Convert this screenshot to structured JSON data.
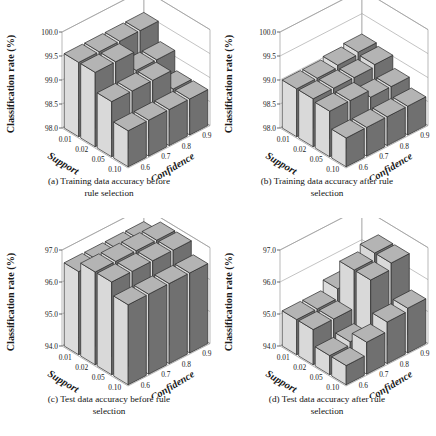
{
  "figure": {
    "background": "#ffffff",
    "ink": "#1a1a1a"
  },
  "colors": {
    "bar_top": "#b4b4b4",
    "bar_left": "#d9d9d9",
    "bar_right": "#707070",
    "bar_front_light": "#dcdcdc",
    "bar_mid": "#9a9a9a",
    "edge": "#2a2a2a",
    "wall": "#9b9b9b",
    "floor": "#ffffff"
  },
  "axes": {
    "ylabel": "Classification rate (%)",
    "xlabel": "Support",
    "zlabel": "Confidence",
    "support_ticks": [
      "0.01",
      "0.02",
      "0.05",
      "0.10"
    ],
    "confidence_ticks": [
      "0.6",
      "0.7",
      "0.8",
      "0.9"
    ]
  },
  "panels": [
    {
      "id": "a",
      "caption": "(a) Training data accuracy before rule selection",
      "caption_line1": "(a) Training data accuracy before",
      "caption_line2": "rule selection",
      "yticks": [
        "98.0",
        "98.5",
        "99.0",
        "99.5",
        "100.0"
      ]
    },
    {
      "id": "b",
      "caption": "(b) Training data accuracy after rule selection",
      "caption_line1": "(b) Training data accuracy after rule",
      "caption_line2": "selection",
      "yticks": [
        "98.0",
        "98.5",
        "99.0",
        "99.5",
        "100.0"
      ]
    },
    {
      "id": "c",
      "caption": "(c) Test data accuracy before rule selection",
      "caption_line1": "(c) Test data accuracy before rule",
      "caption_line2": "selection",
      "yticks": [
        "94.0",
        "95.0",
        "96.0",
        "97.0"
      ]
    },
    {
      "id": "d",
      "caption": "(d) Test data accuracy after rule selection",
      "caption_line1": "(d) Test data accuracy after rule",
      "caption_line2": "selection",
      "yticks": [
        "94.0",
        "95.0",
        "96.0",
        "97.0"
      ]
    }
  ],
  "chart_data": [
    {
      "type": "bar",
      "panel": "a",
      "title": "(a) Training data accuracy before rule selection",
      "xlabel": "Support",
      "ylabel": "Classification rate (%)",
      "zlabel": "Confidence",
      "categories_x": [
        "0.01",
        "0.02",
        "0.05",
        "0.10"
      ],
      "categories_z": [
        "0.6",
        "0.7",
        "0.8",
        "0.9"
      ],
      "ylim": [
        98.0,
        100.0
      ],
      "yticks": [
        98.0,
        98.5,
        99.0,
        99.5,
        100.0
      ],
      "grid": true,
      "note": "values[z_index][x_index]; descending staircase from support 0.01 toward 0.10",
      "values": [
        [
          99.55,
          99.55,
          99.15,
          98.75
        ],
        [
          99.55,
          99.55,
          99.15,
          98.75
        ],
        [
          99.55,
          99.15,
          99.15,
          98.75
        ],
        [
          99.55,
          99.15,
          98.75,
          98.75
        ]
      ]
    },
    {
      "type": "bar",
      "panel": "b",
      "title": "(b) Training data accuracy after rule selection",
      "xlabel": "Support",
      "ylabel": "Classification rate (%)",
      "zlabel": "Confidence",
      "categories_x": [
        "0.01",
        "0.02",
        "0.05",
        "0.10"
      ],
      "categories_z": [
        "0.6",
        "0.7",
        "0.8",
        "0.9"
      ],
      "ylim": [
        98.0,
        100.0
      ],
      "yticks": [
        98.0,
        98.5,
        99.0,
        99.5,
        100.0
      ],
      "grid": true,
      "note": "values[z_index][x_index]; mild staircase, lower overall than (a)",
      "values": [
        [
          99.0,
          99.0,
          98.95,
          98.6
        ],
        [
          99.0,
          99.0,
          98.95,
          98.6
        ],
        [
          99.05,
          99.0,
          98.8,
          98.6
        ],
        [
          99.1,
          99.05,
          98.8,
          98.6
        ]
      ]
    },
    {
      "type": "bar",
      "panel": "c",
      "title": "(c) Test data accuracy before rule selection",
      "xlabel": "Support",
      "ylabel": "Classification rate (%)",
      "zlabel": "Confidence",
      "categories_x": [
        "0.01",
        "0.02",
        "0.05",
        "0.10"
      ],
      "categories_z": [
        "0.6",
        "0.7",
        "0.8",
        "0.9"
      ],
      "ylim": [
        94.0,
        97.0
      ],
      "yticks": [
        94.0,
        95.0,
        96.0,
        97.0
      ],
      "grid": true,
      "note": "values[z_index][x_index]; nearly flat high plateau with small step down at support 0.10",
      "values": [
        [
          96.6,
          96.9,
          96.9,
          96.5
        ],
        [
          96.6,
          96.9,
          96.9,
          96.5
        ],
        [
          96.6,
          96.9,
          96.9,
          96.5
        ],
        [
          96.6,
          96.9,
          96.9,
          96.5
        ]
      ]
    },
    {
      "type": "bar",
      "panel": "d",
      "title": "(d) Test data accuracy after rule selection",
      "xlabel": "Support",
      "ylabel": "Classification rate (%)",
      "zlabel": "Confidence",
      "categories_x": [
        "0.01",
        "0.02",
        "0.05",
        "0.10"
      ],
      "categories_z": [
        "0.6",
        "0.7",
        "0.8",
        "0.9"
      ],
      "ylim": [
        94.0,
        97.0
      ],
      "yticks": [
        94.0,
        95.0,
        96.0,
        97.0
      ],
      "grid": true,
      "note": "values[z_index][x_index]; irregular surface, peaks at mid support and high confidence",
      "values": [
        [
          95.1,
          95.1,
          94.6,
          94.6
        ],
        [
          95.1,
          95.1,
          94.7,
          95.0
        ],
        [
          95.4,
          96.3,
          96.3,
          95.3
        ],
        [
          95.5,
          96.5,
          96.5,
          95.4
        ]
      ]
    }
  ]
}
